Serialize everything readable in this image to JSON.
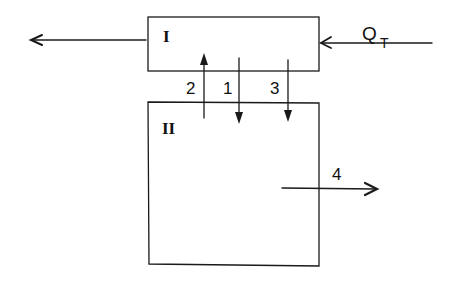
{
  "diagram": {
    "stroke_color": "#1a1a1a",
    "background": "#ffffff",
    "blocks": [
      {
        "id": "block-1",
        "label": "I"
      },
      {
        "id": "block-2",
        "label": "II"
      }
    ],
    "inputs": {
      "heat_input": {
        "label": "Q",
        "subscript": "T"
      }
    },
    "flows": [
      {
        "id": "flow-1",
        "label": "1",
        "direction": "down",
        "from": "I",
        "to": "II"
      },
      {
        "id": "flow-2",
        "label": "2",
        "direction": "up",
        "from": "II",
        "to": "I"
      },
      {
        "id": "flow-3",
        "label": "3",
        "direction": "down",
        "from": "I",
        "to": "II"
      },
      {
        "id": "flow-4",
        "label": "4",
        "direction": "right",
        "from": "II",
        "to": "out"
      }
    ]
  }
}
